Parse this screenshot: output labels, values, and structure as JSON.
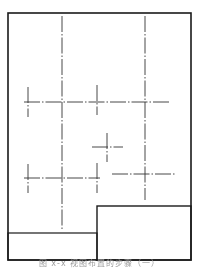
{
  "figure": {
    "caption": "图 x-x  视图布置的步骤（一）",
    "colors": {
      "frame": "#1a1a1a",
      "centerline": "#333333",
      "caption": "#9a9a9a",
      "background": "#ffffff"
    }
  },
  "drawing_sheet": {
    "outer_border": {
      "x": 8,
      "y": 13,
      "width": 183,
      "height": 247
    },
    "title_block_right": {
      "x": 97,
      "y": 206,
      "width": 94,
      "height": 54
    },
    "title_block_left_strip": {
      "x": 8,
      "y": 233,
      "width": 89,
      "height": 27
    }
  },
  "centerlines": [
    {
      "name": "main-vertical-left",
      "x1": 62,
      "y1": 16,
      "x2": 62,
      "y2": 230
    },
    {
      "name": "main-vertical-right",
      "x1": 145,
      "y1": 16,
      "x2": 145,
      "y2": 200
    },
    {
      "name": "upper-horizontal",
      "x1": 24,
      "y1": 102,
      "x2": 171,
      "y2": 102
    },
    {
      "name": "upper-short-vertical-left",
      "x1": 28,
      "y1": 87,
      "x2": 28,
      "y2": 117
    },
    {
      "name": "upper-short-vertical-mid",
      "x1": 97,
      "y1": 85,
      "x2": 97,
      "y2": 115
    },
    {
      "name": "small-cross-horizontal",
      "x1": 92,
      "y1": 147,
      "x2": 123,
      "y2": 147
    },
    {
      "name": "small-cross-vertical",
      "x1": 107,
      "y1": 133,
      "x2": 107,
      "y2": 162
    },
    {
      "name": "lower-horizontal",
      "x1": 24,
      "y1": 178,
      "x2": 100,
      "y2": 178
    },
    {
      "name": "lower-short-vertical-left",
      "x1": 28,
      "y1": 164,
      "x2": 28,
      "y2": 193
    },
    {
      "name": "lower-short-vertical-mid",
      "x1": 97,
      "y1": 163,
      "x2": 97,
      "y2": 193
    },
    {
      "name": "right-horizontal",
      "x1": 112,
      "y1": 174,
      "x2": 175,
      "y2": 174
    }
  ]
}
